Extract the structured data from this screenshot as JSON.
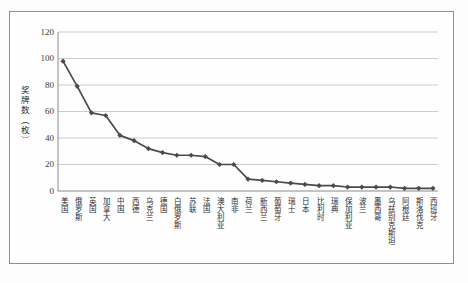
{
  "chart_data": {
    "type": "line",
    "title": "",
    "xlabel": "",
    "ylabel": "奖牌数（枚）",
    "ylim": [
      0,
      120
    ],
    "yticks": [
      0,
      20,
      40,
      60,
      80,
      100,
      120
    ],
    "grid": true,
    "legend_position": "none",
    "line_color": "#4a4a4a",
    "marker": "diamond",
    "grid_color": "#cccccc",
    "axis_color": "#8a8a8a",
    "categories": [
      "美国",
      "俄罗斯",
      "英国",
      "加拿大",
      "中国",
      "西德",
      "乌克兰",
      "德国",
      "白俄罗斯",
      "苏联",
      "法国",
      "澳大利亚",
      "南非",
      "荷兰",
      "新西兰",
      "葡萄牙",
      "瑞士",
      "日本",
      "比利时",
      "瑞典",
      "保加利亚",
      "波兰",
      "墨西哥",
      "乌兹别克斯坦",
      "阿根廷",
      "斯洛伐克",
      "西班牙"
    ],
    "values": [
      98,
      79,
      59,
      57,
      42,
      38,
      32,
      29,
      27,
      27,
      26,
      20,
      20,
      9,
      8,
      7,
      6,
      5,
      4,
      4,
      3,
      3,
      3,
      3,
      2,
      2,
      2
    ]
  }
}
